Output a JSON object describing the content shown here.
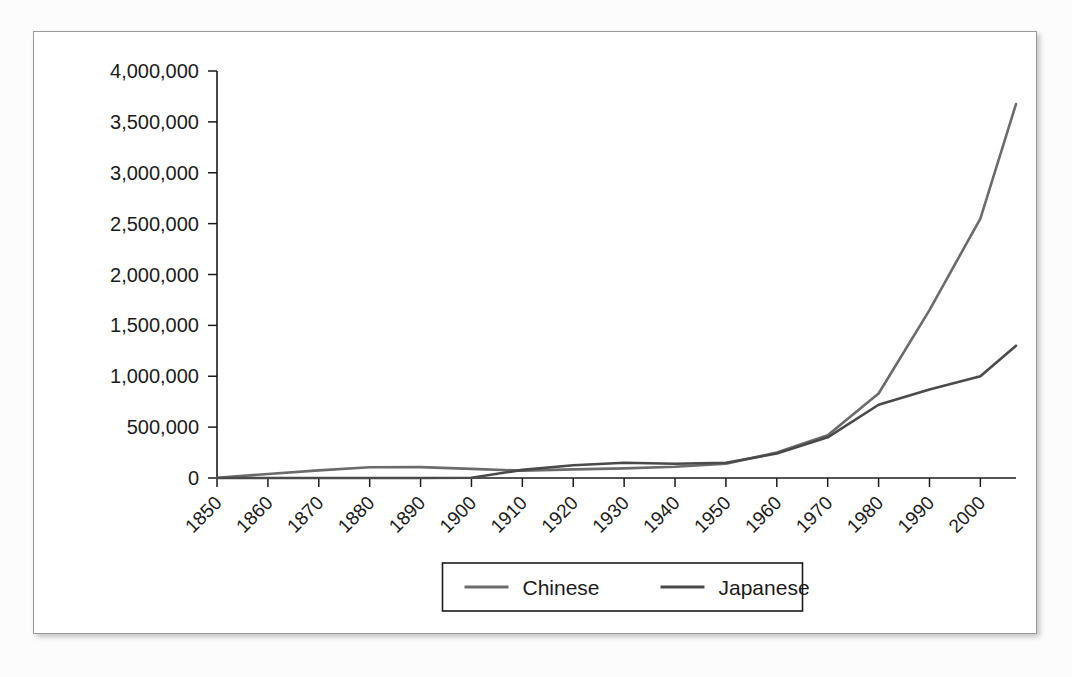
{
  "chart_data": {
    "type": "line",
    "title": "",
    "xlabel": "",
    "ylabel": "",
    "x": [
      1850,
      1860,
      1870,
      1880,
      1890,
      1900,
      1910,
      1920,
      1930,
      1940,
      1950,
      1960,
      1970,
      1980,
      1990,
      2000,
      2007
    ],
    "categories": [
      "1850",
      "1860",
      "1870",
      "1880",
      "1890",
      "1900",
      "1910",
      "1920",
      "1930",
      "1940",
      "1950",
      "1960",
      "1970",
      "1980",
      "1990",
      "2000",
      ""
    ],
    "xlim": [
      1850,
      2007
    ],
    "ylim": [
      0,
      4000000
    ],
    "ytick_values": [
      0,
      500000,
      1000000,
      1500000,
      2000000,
      2500000,
      3000000,
      3500000,
      4000000
    ],
    "ytick_labels": [
      "0",
      "500,000",
      "1,000,000",
      "1,500,000",
      "2,000,000",
      "2,500,000",
      "3,000,000",
      "3,500,000",
      "4,000,000"
    ],
    "xtick_values": [
      1850,
      1860,
      1870,
      1880,
      1890,
      1900,
      1910,
      1920,
      1930,
      1940,
      1950,
      1960,
      1970,
      1980,
      1990,
      2000
    ],
    "xtick_labels": [
      "1850",
      "1860",
      "1870",
      "1880",
      "1890",
      "1900",
      "1910",
      "1920",
      "1930",
      "1940",
      "1950",
      "1960",
      "1970",
      "1980",
      "1990",
      "2000"
    ],
    "xtick_rotation": 45,
    "grid": false,
    "legend_position": "bottom",
    "series": [
      {
        "name": "Chinese",
        "color": "#6b6b6b",
        "values": [
          2000,
          40000,
          75000,
          105000,
          107000,
          90000,
          72000,
          85000,
          95000,
          110000,
          140000,
          250000,
          420000,
          830000,
          1650000,
          2550000,
          3675000
        ]
      },
      {
        "name": "Japanese",
        "color": "#4a4a4a",
        "values": [
          0,
          0,
          0,
          0,
          0,
          3000,
          80000,
          125000,
          150000,
          140000,
          150000,
          240000,
          400000,
          720000,
          870000,
          1000000,
          1300000
        ]
      }
    ]
  },
  "legend": {
    "entries": [
      {
        "label": "Chinese",
        "color": "#6b6b6b"
      },
      {
        "label": "Japanese",
        "color": "#4a4a4a"
      }
    ]
  },
  "colors": {
    "panel_background": "#ffffff",
    "page_background": "#fcfcfc",
    "axis": "#1b1b1b",
    "text": "#1b1b1b",
    "chinese": "#6b6b6b",
    "japanese": "#4a4a4a"
  }
}
